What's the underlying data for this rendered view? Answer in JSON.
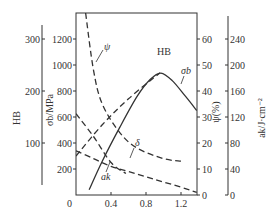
{
  "chart_data": {
    "type": "line",
    "title": "",
    "xlabel": "",
    "xlim": [
      0,
      1.38
    ],
    "x_ticks": [
      "0",
      "0.4",
      "0.8",
      "1.2"
    ],
    "grid": false,
    "axes": {
      "hb": {
        "label": "HB",
        "ticks": [
          "100",
          "200",
          "300"
        ],
        "range": [
          0,
          350
        ]
      },
      "sigma_b": {
        "label": "σb/MPa",
        "ticks": [
          "200",
          "400",
          "600",
          "800",
          "1000",
          "1200"
        ],
        "range": [
          0,
          1400
        ]
      },
      "psi": {
        "label": "ψ(%)",
        "ticks": [
          "0",
          "10",
          "20",
          "30",
          "40",
          "50",
          "60"
        ],
        "range": [
          0,
          70
        ]
      },
      "ak": {
        "label": "ak/J·cm⁻²",
        "ticks": [
          "0",
          "40",
          "80",
          "120",
          "160",
          "200",
          "240"
        ],
        "range": [
          0,
          280
        ]
      }
    },
    "series": [
      {
        "name": "σb",
        "label": "σb",
        "axis": "sigma_b",
        "style": "solid",
        "x": [
          0.15,
          0.3,
          0.5,
          0.7,
          0.85,
          0.97,
          1.1,
          1.25,
          1.38
        ],
        "values": [
          40,
          260,
          520,
          760,
          890,
          938,
          880,
          760,
          650
        ]
      },
      {
        "name": "HB",
        "label": "HB",
        "axis": "hb",
        "style": "dashed",
        "x": [
          0.0,
          0.3,
          0.6,
          0.96
        ],
        "values": [
          75,
          135,
          185,
          235
        ]
      },
      {
        "name": "ψ",
        "label": "ψ",
        "axis": "psi",
        "style": "dashed",
        "x": [
          0.11,
          0.2,
          0.3,
          0.5,
          0.7,
          1.0,
          1.2
        ],
        "values": [
          70,
          48,
          35,
          24,
          18,
          14,
          13
        ]
      },
      {
        "name": "δ",
        "label": "δ",
        "axis": "psi",
        "style": "dashed",
        "x": [
          0.0,
          0.2,
          0.4,
          0.6,
          0.9,
          1.2,
          1.38
        ],
        "values": [
          17,
          14,
          11,
          9,
          6,
          3,
          1
        ]
      },
      {
        "name": "ak",
        "label": "ak",
        "axis": "ak",
        "style": "dashed",
        "x": [
          0.0,
          0.2,
          0.4,
          0.57
        ],
        "values": [
          125,
          90,
          50,
          33
        ]
      }
    ]
  },
  "labels": {
    "hb_axis": "HB",
    "sigma_axis": "σb/MPa",
    "psi_axis": "ψ(%)",
    "ak_axis": "ak/J·cm⁻²",
    "curve_sigma": "σb",
    "curve_hb": "HB",
    "curve_psi": "ψ",
    "curve_delta": "δ",
    "curve_ak": "ak"
  }
}
